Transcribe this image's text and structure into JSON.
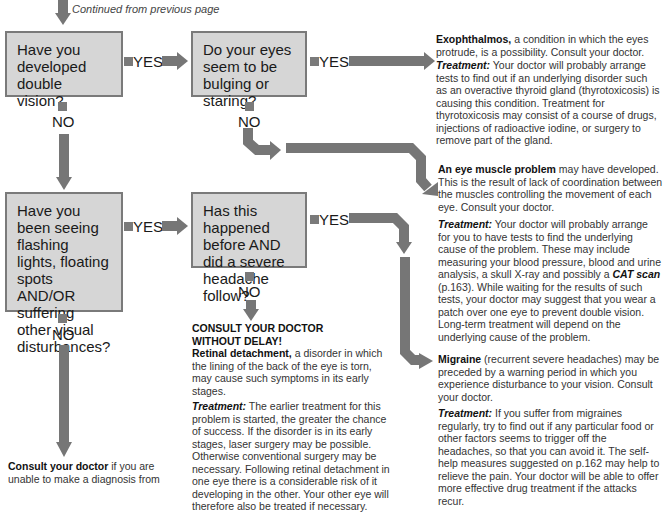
{
  "header": {
    "continued": "Continued from previous page"
  },
  "questions": [
    {
      "id": "q1",
      "text": "Have you developed double vision?"
    },
    {
      "id": "q2",
      "text": "Do your eyes seem to be bulging or staring?"
    },
    {
      "id": "q3",
      "text": "Have you been seeing flashing lights, floating spots AND/OR suffering other visual disturbances?"
    },
    {
      "id": "q4",
      "text": "Has this happened before AND did a severe headache follow?"
    }
  ],
  "labels": {
    "yes": "YES",
    "no": "NO"
  },
  "outcomes": {
    "exophthalmos": {
      "title": "Exophthalmos,",
      "desc": " a condition in which the eyes protrude, is a possibility. Consult your doctor.",
      "treatment_label": "Treatment:",
      "treatment": " Your doctor will probably arrange tests to find out if an underlying disorder such as an overactive thyroid gland (thyrotoxicosis) is causing this condition. Treatment for thyrotoxicosis may consist of a course of drugs, injections of radioactive iodine, or surgery to remove part of the gland."
    },
    "eye_muscle": {
      "title": "An eye muscle problem",
      "desc": " may have developed. This is the result of lack of coordination between the muscles controlling the movement of each eye. Consult your doctor.",
      "treatment_label": "Treatment:",
      "treatment_a": " Your doctor will probably arrange for you to have tests to find the underlying cause of the problem. These may include measuring your blood pressure, blood and urine analysis, a skull X-ray and possibly a ",
      "treatment_italic": "CAT scan",
      "treatment_b": " (p.163). While waiting for the results of such tests, your doctor may suggest that you wear a patch over one eye to prevent double vision. Long-term treatment will depend on the underlying cause of the problem."
    },
    "retinal": {
      "heading": "CONSULT YOUR DOCTOR WITHOUT DELAY!",
      "title": "Retinal detachment,",
      "desc": " a disorder in which the lining of the back of the eye is torn, may cause such symptoms in its early stages.",
      "treatment_label": "Treatment:",
      "treatment": " The earlier treatment for this problem is started, the greater the chance of success. If the disorder is in its early stages, laser surgery may be possible. Otherwise conventional surgery may be necessary. Following retinal detachment in one eye there is a considerable risk of it developing in the other. Your other eye will therefore also be treated if necessary."
    },
    "migraine": {
      "title": "Migraine",
      "desc": " (recurrent severe headaches) may be preceded by a warning period in which you experience disturbance to your vision. Consult your doctor.",
      "treatment_label": "Treatment:",
      "treatment": " If you suffer from migraines regularly, try to find out if any particular food or other factors seems to trigger off the headaches, so that you can avoid it. The self-help measures suggested on p.162 may help to relieve the pain. Your doctor will be able to offer more effective drug treatment if the attacks recur."
    },
    "consult": {
      "title": "Consult your doctor",
      "desc": " if you are unable to make a diagnosis from"
    }
  },
  "colors": {
    "box_fill": "#d6d6d6",
    "box_border": "#7a7a7a",
    "arrow": "#767676"
  }
}
